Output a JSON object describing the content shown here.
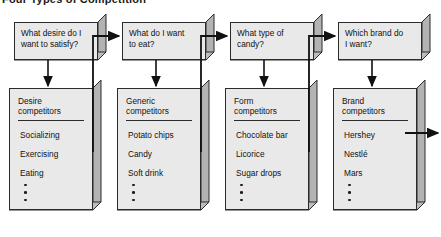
{
  "title": "Four Types of Competition",
  "colors": {
    "box_face": "#e9e9e9",
    "box_side": "#b3b3b3",
    "box_bottom": "#bdbdbd",
    "outline": "#2b2b2b",
    "arrow": "#111111",
    "background": "#ffffff"
  },
  "columns": [
    {
      "question": "What desire do I\nwant to satisfy?",
      "question_line1": "What desire do I",
      "question_line2": "want to satisfy?",
      "competitor_head_line1": "Desire",
      "competitor_head_line2": "competitors",
      "items": [
        "Socializing",
        "Exercising",
        "Eating"
      ],
      "ellipsis_dots": 3
    },
    {
      "question": "What do I want\nto eat?",
      "question_line1": "What do I want",
      "question_line2": "to eat?",
      "competitor_head_line1": "Generic",
      "competitor_head_line2": "competitors",
      "items": [
        "Potato chips",
        "Candy",
        "Soft drink"
      ],
      "ellipsis_dots": 3
    },
    {
      "question": "What type of\ncandy?",
      "question_line1": "What type of",
      "question_line2": "candy?",
      "competitor_head_line1": "Form",
      "competitor_head_line2": "competitors",
      "items": [
        "Chocolate bar",
        "Licorice",
        "Sugar drops"
      ],
      "ellipsis_dots": 3
    },
    {
      "question": "Which brand do\nI want?",
      "question_line1": "Which brand do",
      "question_line2": "I want?",
      "competitor_head_line1": "Brand",
      "competitor_head_line2": "competitors",
      "items": [
        "Hershey",
        "Nestlé",
        "Mars"
      ],
      "ellipsis_dots": 3
    }
  ],
  "connectors": {
    "down_arrow_label": "question-to-competitors-arrow",
    "right_arrow_label": "competitors-to-next-question-arrow",
    "exit_arrow_label": "final-exit-arrow"
  }
}
